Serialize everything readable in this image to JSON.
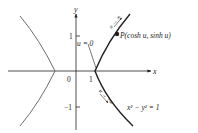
{
  "axes": {
    "x_label": "x",
    "y_label": "y",
    "origin_label": "0",
    "x_tick_1": "1",
    "y_tick_pos": "1",
    "y_tick_neg": "−1"
  },
  "annotations": {
    "u_zero": "u = 0",
    "point": "P(cosh u, sinh u)",
    "equation": "x² − y² = 1",
    "arrow_up": "u → ∞",
    "arrow_down": "u → −∞"
  },
  "colors": {
    "right_branch": "#231f20",
    "left_branch": "#6d6e71",
    "axes": "#231f20"
  }
}
